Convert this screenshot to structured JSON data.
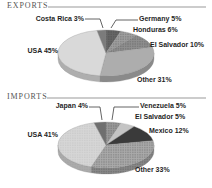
{
  "page": {
    "background": "#ffffff",
    "style": "grayscale-3d-pie-infographic"
  },
  "sections": {
    "exports": {
      "title": "EXPORTS"
    },
    "imports": {
      "title": "IMPORTS"
    }
  },
  "chart_data": [
    {
      "type": "pie",
      "variant": "3d",
      "title": "EXPORTS",
      "legend": "none",
      "labels_on_chart": true,
      "label_format": "{label} {value}%",
      "order": "clockwise-from-top",
      "slices": [
        {
          "label": "Germany",
          "value": 5,
          "color": "#666666",
          "texture": "dots-dark"
        },
        {
          "label": "Honduras",
          "value": 6,
          "color": "#9f9f9f",
          "texture": "dots-dark"
        },
        {
          "label": "El Salvador",
          "value": 10,
          "color": "#8f8f8f",
          "texture": "dots-dark"
        },
        {
          "label": "Other",
          "value": 31,
          "color": "#adadad",
          "texture": "none"
        },
        {
          "label": "USA",
          "value": 45,
          "color": "#d9d9d9",
          "texture": "none"
        },
        {
          "label": "Costa Rica",
          "value": 3,
          "color": "#7b7b7b",
          "texture": "none"
        }
      ]
    },
    {
      "type": "pie",
      "variant": "3d",
      "title": "IMPORTS",
      "legend": "none",
      "labels_on_chart": true,
      "label_format": "{label} {value}%",
      "order": "clockwise-from-top",
      "slices": [
        {
          "label": "Venezuela",
          "value": 5,
          "color": "#9a9a9a",
          "texture": "dots-dark"
        },
        {
          "label": "El Salvador",
          "value": 5,
          "color": "#c4c4c4",
          "texture": "none"
        },
        {
          "label": "Mexico",
          "value": 12,
          "color": "#3a3a3a",
          "texture": "none"
        },
        {
          "label": "Other",
          "value": 33,
          "color": "#aaaaaa",
          "texture": "dots-dark"
        },
        {
          "label": "USA",
          "value": 41,
          "color": "#d6d6d6",
          "texture": "dots-light"
        },
        {
          "label": "Japan",
          "value": 4,
          "color": "#6f6f6f",
          "texture": "none"
        }
      ]
    }
  ]
}
